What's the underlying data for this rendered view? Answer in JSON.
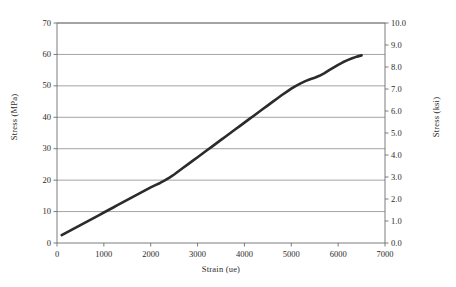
{
  "chart_data": {
    "type": "line",
    "title": "",
    "xlabel": "Strain (ue)",
    "ylabel": "Stress (MPa)",
    "y2label": "Stress (ksi)",
    "xlim": [
      0,
      7000
    ],
    "ylim": [
      0,
      70
    ],
    "y2lim": [
      0.0,
      10.0
    ],
    "grid": "horizontal",
    "legend": "none",
    "xticks": [
      "0",
      "1000",
      "2000",
      "3000",
      "4000",
      "5000",
      "6000",
      "7000"
    ],
    "xtick_values": [
      0,
      1000,
      2000,
      3000,
      4000,
      5000,
      6000,
      7000
    ],
    "yticks": [
      "0",
      "10",
      "20",
      "30",
      "40",
      "50",
      "60",
      "70"
    ],
    "ytick_values": [
      0,
      10,
      20,
      30,
      40,
      50,
      60,
      70
    ],
    "y2ticks": [
      "0.0",
      "1.0",
      "2.0",
      "3.0",
      "4.0",
      "5.0",
      "6.0",
      "7.0",
      "8.0",
      "9.0",
      "10.0"
    ],
    "y2tick_values": [
      0.0,
      1.0,
      2.0,
      3.0,
      4.0,
      5.0,
      6.0,
      7.0,
      8.0,
      9.0,
      10.0
    ],
    "series": [
      {
        "name": "stress-strain",
        "color": "#2b2b2b",
        "linewidth": 2.6,
        "x": [
          100,
          200,
          300,
          400,
          500,
          600,
          700,
          800,
          900,
          1000,
          1100,
          1200,
          1300,
          1400,
          1500,
          1600,
          1700,
          1800,
          1900,
          2000,
          2100,
          2200,
          2300,
          2400,
          2500,
          2600,
          2700,
          2800,
          2900,
          3000,
          3100,
          3200,
          3300,
          3400,
          3500,
          3600,
          3700,
          3800,
          3900,
          4000,
          4100,
          4200,
          4300,
          4400,
          4500,
          4600,
          4700,
          4800,
          4900,
          5000,
          5100,
          5200,
          5300,
          5400,
          5500,
          5600,
          5700,
          5800,
          5900,
          6000,
          6100,
          6200,
          6300,
          6400,
          6500
        ],
        "values": [
          2.5,
          3.3,
          4.1,
          4.9,
          5.7,
          6.5,
          7.3,
          8.1,
          8.9,
          9.7,
          10.5,
          11.3,
          12.1,
          12.9,
          13.7,
          14.5,
          15.3,
          16.1,
          16.9,
          17.7,
          18.4,
          19.1,
          19.9,
          20.8,
          21.8,
          22.9,
          24.0,
          25.1,
          26.2,
          27.3,
          28.4,
          29.5,
          30.6,
          31.7,
          32.8,
          33.9,
          35.0,
          36.1,
          37.2,
          38.3,
          39.4,
          40.5,
          41.6,
          42.7,
          43.8,
          44.9,
          46.0,
          47.1,
          48.1,
          49.1,
          50.0,
          50.8,
          51.5,
          52.1,
          52.6,
          53.2,
          54.0,
          54.9,
          55.8,
          56.7,
          57.5,
          58.2,
          58.8,
          59.3,
          59.7
        ]
      }
    ]
  },
  "axes": {
    "x_title": "Strain (ue)",
    "y_left_title": "Stress (MPa)",
    "y_right_title": "Stress (ksi)"
  }
}
